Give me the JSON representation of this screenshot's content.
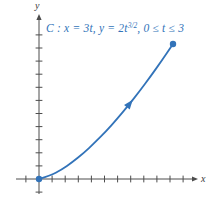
{
  "figure": {
    "background": "#ffffff",
    "curve_color": "#3273b9",
    "axis_color": "#4d4d4d",
    "title": {
      "prefix": "C : x = 3t, y = 2t",
      "superscript": "3/2",
      "suffix": ", 0 ≤ t ≤ 3"
    },
    "x_axis_label": "x",
    "y_axis_label": "y"
  },
  "chart_data": {
    "type": "line",
    "parametric": {
      "x_of_t": "3t",
      "y_of_t": "2t^{3/2}",
      "t_min": 0,
      "t_max": 3
    },
    "xlabel": "x",
    "ylabel": "y",
    "grid": false,
    "tick_labels_shown": false,
    "ticks": {
      "x_min_index": -1,
      "x_max_index": 11,
      "y_min_index": -1,
      "y_max_index": 11
    },
    "points": [
      {
        "t": 0.0,
        "x": 0.0,
        "y": 0.0
      },
      {
        "t": 0.25,
        "x": 0.75,
        "y": 0.25
      },
      {
        "t": 0.5,
        "x": 1.5,
        "y": 0.71
      },
      {
        "t": 0.75,
        "x": 2.25,
        "y": 1.3
      },
      {
        "t": 1.0,
        "x": 3.0,
        "y": 2.0
      },
      {
        "t": 1.25,
        "x": 3.75,
        "y": 2.8
      },
      {
        "t": 1.5,
        "x": 4.5,
        "y": 3.67
      },
      {
        "t": 1.75,
        "x": 5.25,
        "y": 4.63
      },
      {
        "t": 2.0,
        "x": 6.0,
        "y": 5.66
      },
      {
        "t": 2.25,
        "x": 6.75,
        "y": 6.75
      },
      {
        "t": 2.5,
        "x": 7.5,
        "y": 7.91
      },
      {
        "t": 2.75,
        "x": 8.25,
        "y": 9.12
      },
      {
        "t": 3.0,
        "x": 9.0,
        "y": 10.39
      }
    ],
    "start_marker": {
      "x": 0,
      "y": 0,
      "style": "filled-dot"
    },
    "end_marker": {
      "x": 9,
      "y": 10.39,
      "style": "filled-dot"
    },
    "direction_arrow": {
      "t": 2.1,
      "x": 6.3,
      "y": 6.09
    }
  }
}
